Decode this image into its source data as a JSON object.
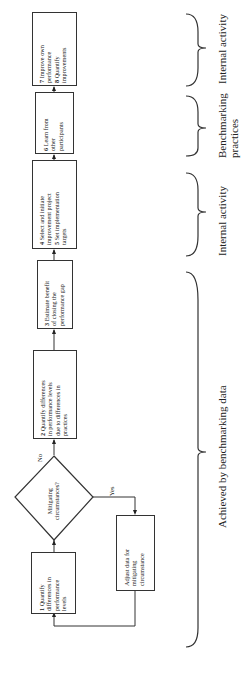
{
  "flowchart": {
    "boxes": {
      "step1": {
        "num": "1",
        "lines": [
          "Quantify",
          "differences in",
          "performance",
          "levels"
        ]
      },
      "step2": {
        "num": "2",
        "lines": [
          "Quantify differences",
          "in performance levels",
          "due to differences in",
          "practices"
        ]
      },
      "step3": {
        "num": "3",
        "lines": [
          "Estimate benefit",
          "of closing the",
          "performance gap"
        ]
      },
      "step45": {
        "num4": "4",
        "line4a": "Select and initiate",
        "line4b": "improvement project",
        "num5": "5",
        "line5a": "Set implementation",
        "line5b": "targets"
      },
      "step6": {
        "num": "6",
        "lines": [
          "Learn from",
          "other",
          "participants"
        ]
      },
      "step78": {
        "num7": "7",
        "line7a": "Improve own",
        "line7b": "performance",
        "num8": "8",
        "line8a": "Quantify",
        "line8b": "improvements"
      },
      "adjust": {
        "lines": [
          "Adjust data for",
          "mitigating",
          "circumstance"
        ]
      }
    },
    "decision": {
      "lines": [
        "Mitigating",
        "circumstances?"
      ],
      "no_label": "No",
      "yes_label": "Yes"
    }
  },
  "braces": [
    {
      "label": "Internal activity"
    },
    {
      "label_line1": "Benchmarking",
      "label_line2": "practices"
    },
    {
      "label": "Internal activity"
    },
    {
      "label": "Achieved by benchmarking data"
    }
  ]
}
